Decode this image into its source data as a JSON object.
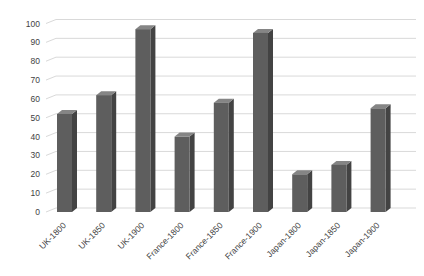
{
  "chart": {
    "background": "#ffffff",
    "bar_front_color": "#5e5e5e",
    "bar_side_color": "#434343",
    "bar_top_color": "#858585",
    "gridline_color": "#d9d9d9",
    "label_color": "#3f3f3f"
  },
  "chart_data": {
    "type": "bar",
    "style": "3d-column",
    "title": "",
    "xlabel": "",
    "ylabel": "",
    "categories": [
      "UK-1800",
      "UK-1850",
      "UK-1900",
      "France-1800",
      "France-1850",
      "France-1900",
      "Japan-1800",
      "Japan-1850",
      "Japan-1900"
    ],
    "values": [
      52,
      62,
      97,
      40,
      58,
      95,
      20,
      25,
      55
    ],
    "ylim": [
      0,
      100
    ],
    "ytick_step": 10,
    "ytick_labels": [
      "0",
      "10",
      "20",
      "30",
      "40",
      "50",
      "60",
      "70",
      "80",
      "90",
      "100"
    ],
    "grid": true,
    "legend": false,
    "x_label_rotation_deg": -45
  }
}
